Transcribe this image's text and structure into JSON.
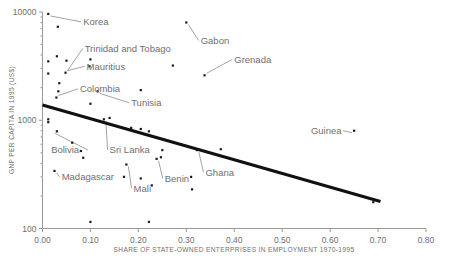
{
  "chart_data": {
    "type": "scatter",
    "title": "",
    "subtitle": "",
    "xlabel": "SHARE OF STATE-OWNED ENTERPRISES IN EMPLOYMENT 1970-1995",
    "ylabel": "GNP PER CAPITA IN 1995 (US$)",
    "xlim": [
      0.0,
      0.8
    ],
    "ylim": [
      100,
      10000
    ],
    "yscale": "log",
    "xscale": "linear",
    "grid": false,
    "legend": false,
    "xticks": [
      "0.00",
      "0.10",
      "0.20",
      "0.30",
      "0.40",
      "0.50",
      "0.60",
      "0.70",
      "0.80"
    ],
    "xtick_values": [
      0.0,
      0.1,
      0.2,
      0.3,
      0.4,
      0.5,
      0.6,
      0.7,
      0.8
    ],
    "yticks": [
      "100",
      "1000",
      "10000"
    ],
    "ytick_values": [
      100,
      1000,
      10000
    ],
    "point_color": "#1a1a1a",
    "line_color": "#111111",
    "text_color": "#6f6f6f",
    "axis_color": "#9a9a9a",
    "background": "#ffffff",
    "points": [
      {
        "x": 0.012,
        "y": 9600
      },
      {
        "x": 0.032,
        "y": 7300
      },
      {
        "x": 0.3,
        "y": 8000
      },
      {
        "x": 0.03,
        "y": 3900
      },
      {
        "x": 0.012,
        "y": 3500
      },
      {
        "x": 0.05,
        "y": 3550
      },
      {
        "x": 0.1,
        "y": 3650
      },
      {
        "x": 0.098,
        "y": 3150
      },
      {
        "x": 0.048,
        "y": 2750
      },
      {
        "x": 0.012,
        "y": 2700
      },
      {
        "x": 0.272,
        "y": 3200
      },
      {
        "x": 0.338,
        "y": 2600
      },
      {
        "x": 0.035,
        "y": 2200
      },
      {
        "x": 0.033,
        "y": 1850
      },
      {
        "x": 0.029,
        "y": 1620
      },
      {
        "x": 0.115,
        "y": 1850
      },
      {
        "x": 0.205,
        "y": 1900
      },
      {
        "x": 0.1,
        "y": 1420
      },
      {
        "x": 0.012,
        "y": 1020
      },
      {
        "x": 0.012,
        "y": 960
      },
      {
        "x": 0.03,
        "y": 790
      },
      {
        "x": 0.128,
        "y": 1020
      },
      {
        "x": 0.14,
        "y": 1050
      },
      {
        "x": 0.185,
        "y": 850
      },
      {
        "x": 0.205,
        "y": 830
      },
      {
        "x": 0.222,
        "y": 790
      },
      {
        "x": 0.062,
        "y": 620
      },
      {
        "x": 0.08,
        "y": 520
      },
      {
        "x": 0.085,
        "y": 450
      },
      {
        "x": 0.25,
        "y": 530
      },
      {
        "x": 0.322,
        "y": 530
      },
      {
        "x": 0.372,
        "y": 540
      },
      {
        "x": 0.65,
        "y": 800
      },
      {
        "x": 0.238,
        "y": 440
      },
      {
        "x": 0.247,
        "y": 455
      },
      {
        "x": 0.025,
        "y": 340
      },
      {
        "x": 0.175,
        "y": 390
      },
      {
        "x": 0.205,
        "y": 290
      },
      {
        "x": 0.17,
        "y": 300
      },
      {
        "x": 0.228,
        "y": 250
      },
      {
        "x": 0.31,
        "y": 300
      },
      {
        "x": 0.312,
        "y": 230
      },
      {
        "x": 0.1,
        "y": 115
      },
      {
        "x": 0.222,
        "y": 115
      },
      {
        "x": 0.69,
        "y": 175
      }
    ],
    "trend_line": {
      "x_start": 0.0,
      "y_start": 1380,
      "x_end": 0.705,
      "y_end": 178,
      "label": "fitted trend"
    },
    "annotations": [
      {
        "label": "Korea",
        "text_x": 0.085,
        "text_y": 8100,
        "point_x": 0.012,
        "point_y": 9600
      },
      {
        "label": "Trinidad and Tobago",
        "text_x": 0.088,
        "text_y": 4600,
        "point_x": 0.048,
        "point_y": 2750
      },
      {
        "label": "Gabon",
        "text_x": 0.33,
        "text_y": 5450,
        "point_x": 0.3,
        "point_y": 8000
      },
      {
        "label": "Mauritius",
        "text_x": 0.092,
        "text_y": 3150,
        "point_x": 0.048,
        "point_y": 2750
      },
      {
        "label": "Grenada",
        "text_x": 0.4,
        "text_y": 3650,
        "point_x": 0.338,
        "point_y": 2600
      },
      {
        "label": "Colombia",
        "text_x": 0.078,
        "text_y": 1950,
        "point_x": 0.029,
        "point_y": 1620
      },
      {
        "label": "Tunisia",
        "text_x": 0.185,
        "text_y": 1450,
        "point_x": 0.115,
        "point_y": 1850
      },
      {
        "label": "Guinea",
        "text_x": 0.56,
        "text_y": 800,
        "point_x": 0.65,
        "point_y": 800
      },
      {
        "label": "Bolivia",
        "text_x": 0.018,
        "text_y": 530,
        "point_x": 0.03,
        "point_y": 790
      },
      {
        "label": "Sri Lanka",
        "text_x": 0.14,
        "text_y": 530,
        "point_x": 0.128,
        "point_y": 1020
      },
      {
        "label": "Ghana",
        "text_x": 0.34,
        "text_y": 330,
        "point_x": 0.322,
        "point_y": 530
      },
      {
        "label": "Benin",
        "text_x": 0.255,
        "text_y": 290,
        "point_x": 0.238,
        "point_y": 440
      },
      {
        "label": "Madagascar",
        "text_x": 0.04,
        "text_y": 300,
        "point_x": 0.025,
        "point_y": 340
      },
      {
        "label": "Mali",
        "text_x": 0.19,
        "text_y": 235,
        "point_x": 0.175,
        "point_y": 390
      }
    ]
  }
}
